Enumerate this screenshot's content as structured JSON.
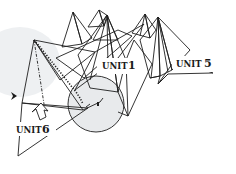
{
  "diagram": {
    "title": "",
    "labels": {
      "unit1": {
        "word": "UNIT",
        "num": "1"
      },
      "unit5": {
        "word": "UNIT",
        "num": "5"
      },
      "unit6": {
        "word": "UNIT",
        "num": "6"
      }
    },
    "colors": {
      "yellow": "#f6ec9a",
      "light_yellow": "#f4f1d4",
      "green": "#dcecd0",
      "pink": "#f4d8d6",
      "gray": "#dedede",
      "light_gray": "#ececec",
      "circle_gray": "#e6e8ea",
      "line": "#1e1e1e"
    },
    "symbols": {
      "insert_arrow": "push-arrow",
      "pointer": "arrowhead"
    }
  }
}
